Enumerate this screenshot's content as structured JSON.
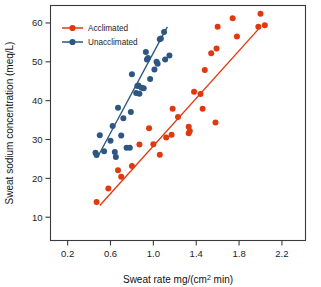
{
  "chart_data": {
    "type": "scatter",
    "title": "",
    "xlabel": "Sweat rate mg/(cm² min)",
    "ylabel": "Sweat sodium concentration (meq/L)",
    "xlim": [
      0.04,
      2.42
    ],
    "ylim": [
      4.0,
      64.5
    ],
    "xticks": [
      0.2,
      0.6,
      1.0,
      1.4,
      1.8,
      2.2
    ],
    "xtick_labels": [
      "0.2",
      "0.6",
      "1.0",
      "1.4",
      "1.8",
      "2.2"
    ],
    "yticks": [
      10,
      20,
      30,
      40,
      50,
      60
    ],
    "ytick_labels": [
      "10",
      "20",
      "30",
      "40",
      "50",
      "60"
    ],
    "grid": false,
    "legend_position": "top-left",
    "series": [
      {
        "name": "Acclimated",
        "color": "#e0380f",
        "marker": "circle",
        "points": [
          [
            0.47,
            13.9
          ],
          [
            0.58,
            17.4
          ],
          [
            0.67,
            22.1
          ],
          [
            0.7,
            20.4
          ],
          [
            0.8,
            23.2
          ],
          [
            0.87,
            28.7
          ],
          [
            0.96,
            32.9
          ],
          [
            1.0,
            28.8
          ],
          [
            1.06,
            26.1
          ],
          [
            1.12,
            30.5
          ],
          [
            1.17,
            31.2
          ],
          [
            1.18,
            37.9
          ],
          [
            1.23,
            35.8
          ],
          [
            1.33,
            33.3
          ],
          [
            1.33,
            31.6
          ],
          [
            1.34,
            32.2
          ],
          [
            1.38,
            42.3
          ],
          [
            1.44,
            41.7
          ],
          [
            1.46,
            37.9
          ],
          [
            1.48,
            47.9
          ],
          [
            1.54,
            52.2
          ],
          [
            1.58,
            34.4
          ],
          [
            1.59,
            53.4
          ],
          [
            1.6,
            59.0
          ],
          [
            1.74,
            61.2
          ],
          [
            1.78,
            56.5
          ],
          [
            1.98,
            59.0
          ],
          [
            2.0,
            62.4
          ],
          [
            2.04,
            59.4
          ]
        ],
        "fit_line": {
          "x1": 0.5,
          "y1": 13.0,
          "x2": 2.0,
          "y2": 59.0
        }
      },
      {
        "name": "Unacclimated",
        "color": "#2d5681",
        "marker": "circle",
        "points": [
          [
            0.46,
            26.6
          ],
          [
            0.47,
            26.0
          ],
          [
            0.5,
            31.1
          ],
          [
            0.54,
            27.0
          ],
          [
            0.6,
            29.7
          ],
          [
            0.62,
            33.5
          ],
          [
            0.64,
            26.8
          ],
          [
            0.65,
            25.5
          ],
          [
            0.67,
            38.2
          ],
          [
            0.7,
            31.0
          ],
          [
            0.72,
            35.5
          ],
          [
            0.75,
            27.9
          ],
          [
            0.78,
            27.9
          ],
          [
            0.79,
            37.1
          ],
          [
            0.8,
            46.8
          ],
          [
            0.84,
            42.0
          ],
          [
            0.85,
            43.8
          ],
          [
            0.86,
            43.9
          ],
          [
            0.87,
            41.8
          ],
          [
            0.89,
            43.3
          ],
          [
            0.91,
            43.2
          ],
          [
            0.93,
            52.5
          ],
          [
            0.94,
            50.6
          ],
          [
            0.95,
            51.0
          ],
          [
            0.97,
            45.6
          ],
          [
            1.01,
            48.0
          ],
          [
            1.03,
            50.0
          ],
          [
            1.04,
            49.5
          ],
          [
            1.06,
            55.8
          ],
          [
            1.07,
            56.0
          ],
          [
            1.1,
            57.7
          ],
          [
            1.11,
            50.6
          ],
          [
            1.15,
            51.6
          ]
        ],
        "fit_line": {
          "x1": 0.49,
          "y1": 26.0,
          "x2": 1.13,
          "y2": 59.0
        }
      }
    ]
  },
  "legend": {
    "entries": [
      {
        "label": "Acclimated",
        "color": "#e0380f"
      },
      {
        "label": "Unacclimated",
        "color": "#2d5681"
      }
    ]
  },
  "axes": {
    "x_title_main": "Sweat rate mg/(cm",
    "x_title_sup": "2",
    "x_title_tail": " min)",
    "y_title": "Sweat sodium concentration (meq/L)"
  }
}
